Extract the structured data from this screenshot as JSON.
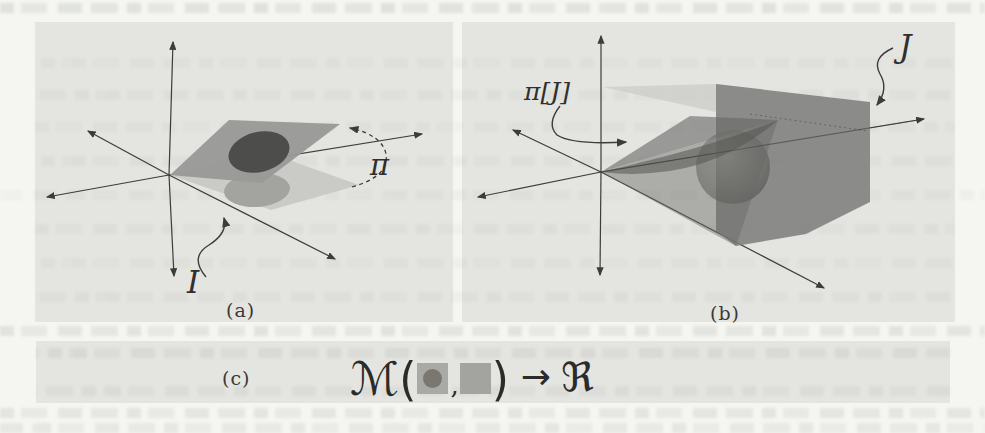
{
  "figure": {
    "panel_a": {
      "caption": "(a)",
      "pi_label": "π",
      "i_label": "I"
    },
    "panel_b": {
      "caption": "(b)",
      "pij_label": "π[J]",
      "j_label": "J"
    },
    "panel_c": {
      "caption": "(c)",
      "formula": {
        "m": "ℳ",
        "open": "(",
        "comma": ",",
        "close": ")",
        "arrow": "→",
        "r": "ℜ"
      }
    },
    "colors": {
      "panel_bg": "#e4e4e1",
      "axis": "#3c3c3a",
      "upper_plane": "#999997",
      "upper_ellipse": "#4d4d4b",
      "lower_plane": "#c8c8c5",
      "lower_ellipse": "#a3a3a0",
      "light_triangle": "#cfcfcc",
      "box": "#7d7d7b",
      "wedge": "#686866",
      "sphere_dark": "#555551",
      "square1": "#a9a9a6",
      "square1_dot": "#7a7670",
      "square2": "#a3a3a0"
    }
  }
}
